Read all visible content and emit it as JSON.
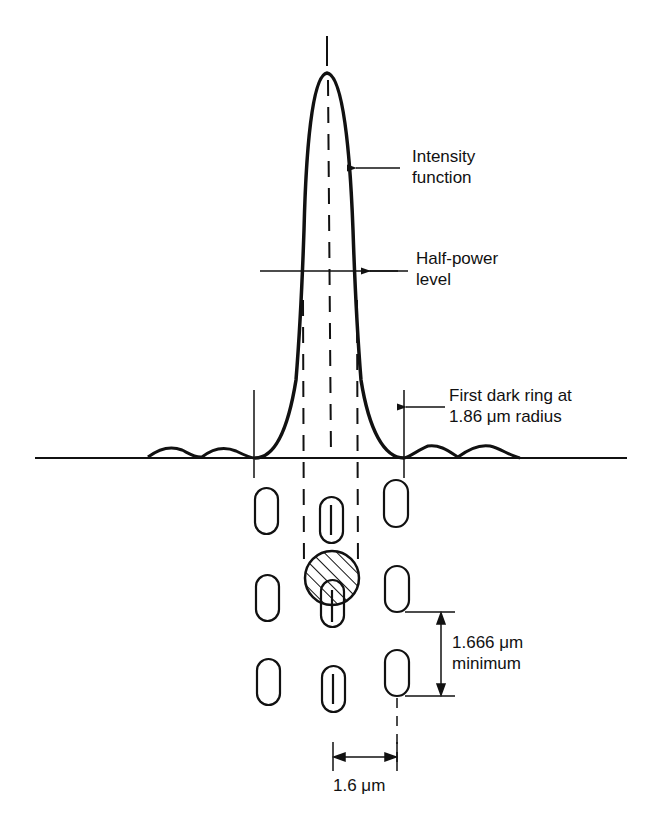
{
  "labels": {
    "intensity_line1": "Intensity",
    "intensity_line2": "function",
    "halfpower_line1": "Half-power",
    "halfpower_line2": "level",
    "darkring_line1": "First dark ring at",
    "darkring_line2": "1.86 μm radius",
    "track_pitch_line1": "1.666 μm",
    "track_pitch_line2": "minimum",
    "track_spacing": "1.6 μm"
  },
  "figure": {
    "first_dark_ring_radius_um": 1.86,
    "pit_pitch_min_um": 1.666,
    "track_pitch_um": 1.6,
    "pit_columns": 3,
    "pit_rows": 3,
    "stroke_color": "#111111",
    "background_color": "#ffffff"
  }
}
